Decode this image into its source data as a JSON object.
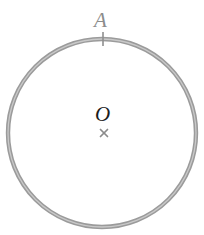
{
  "figure": {
    "background_color": "#ffffff",
    "width": 204,
    "height": 235
  },
  "chart_data": {
    "type": "scatter",
    "title": "",
    "xlabel": "",
    "ylabel": "",
    "grid": false,
    "legend": null,
    "shapes": [
      {
        "name": "main-circle",
        "kind": "circle",
        "center_x": 102,
        "center_y": 133,
        "radius": 94,
        "stroke_color": "#9b9b9b",
        "stroke_width": 4.4,
        "fill": "none"
      },
      {
        "name": "circle-inner-highlight",
        "kind": "circle",
        "center_x": 102,
        "center_y": 133,
        "radius": 94,
        "stroke_color": "#c9c9c9",
        "stroke_width": 1.3,
        "fill": "none"
      },
      {
        "name": "point-a-tick",
        "kind": "line",
        "x1": 103,
        "y1": 32,
        "x2": 103,
        "y2": 46,
        "stroke_color": "#8f8f8f",
        "stroke_width": 1.6
      },
      {
        "name": "center-cross-stroke-1",
        "kind": "line",
        "x1": 100.5,
        "y1": 129.5,
        "x2": 107.5,
        "y2": 136.5,
        "stroke_color": "#8c8c8c",
        "stroke_width": 1.7
      },
      {
        "name": "center-cross-stroke-2",
        "kind": "line",
        "x1": 107.5,
        "y1": 129.5,
        "x2": 100.5,
        "y2": 136.5,
        "stroke_color": "#8c8c8c",
        "stroke_width": 1.7
      }
    ],
    "points": [
      {
        "label": "A",
        "role": "point-on-circle",
        "x": 103,
        "y": 39,
        "label_x": 104,
        "label_y": 21,
        "label_color": "#8c8c8c"
      },
      {
        "label": "O",
        "role": "center",
        "x": 104,
        "y": 133,
        "label_x": 104,
        "label_y": 115,
        "label_color": "#1c1c1c"
      }
    ],
    "annotations": [
      {
        "text": "A",
        "x": 104,
        "y": 21
      },
      {
        "text": "O",
        "x": 104,
        "y": 115
      }
    ]
  },
  "labels": {
    "point_a": "A",
    "center_o": "O"
  },
  "colors": {
    "circle_stroke": "#9b9b9b",
    "circle_highlight": "#c9c9c9",
    "label_a": "#8c8c8c",
    "label_o": "#1c1c1c",
    "marker": "#8c8c8c",
    "background": "#ffffff"
  }
}
